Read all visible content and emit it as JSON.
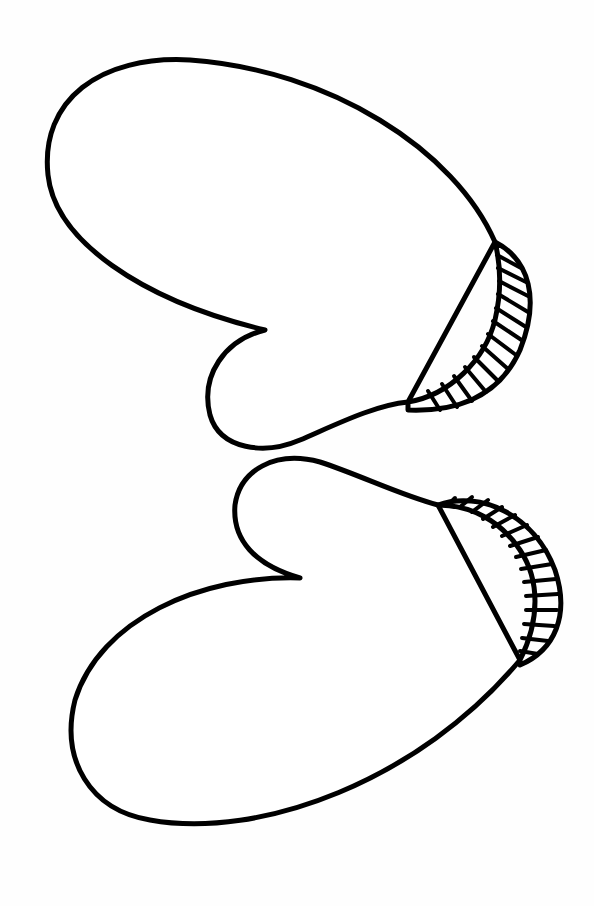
{
  "image": {
    "subject": "Two mittens line drawing",
    "style": "black outline on white background",
    "colors": {
      "background": "#fefefe",
      "line": "#000000",
      "fill": "#ffffff"
    }
  },
  "mittens": [
    {
      "label": "Top mitten",
      "cuff": "ribbed cuff on right side"
    },
    {
      "label": "Bottom mitten",
      "cuff": "ribbed cuff on right side"
    }
  ]
}
